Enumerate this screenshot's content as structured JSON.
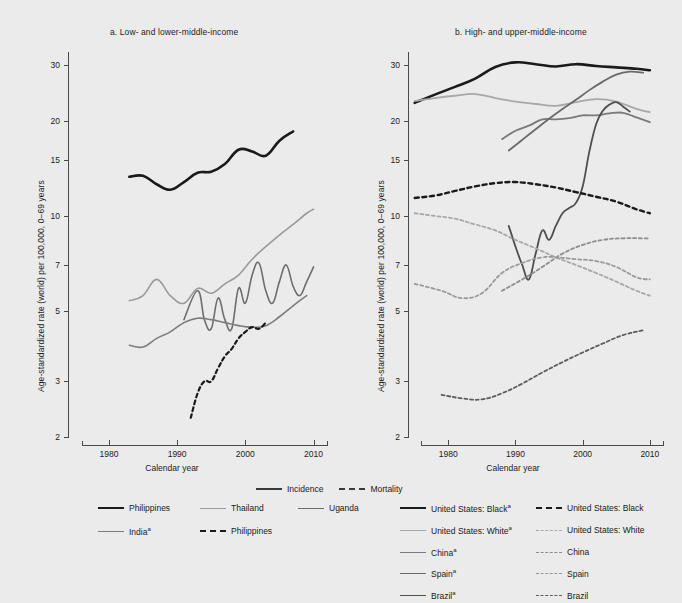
{
  "figure": {
    "background": "#ebebeb",
    "panels": [
      {
        "id": "a",
        "title": "a. Low- and lower-middle-income"
      },
      {
        "id": "b",
        "title": "b. High- and upper-middle-income"
      }
    ],
    "axis_label_y": "Age-standardized rate (world) per 100,000, 0–69 years",
    "axis_label_x": "Calendar year"
  },
  "legend_style": {
    "items": [
      {
        "label": "Incidence",
        "style": "solid",
        "color": "#3a3a3a",
        "icon": "line-solid-icon"
      },
      {
        "label": "Mortality",
        "style": "dashed",
        "color": "#3a3a3a",
        "icon": "line-dashed-icon"
      }
    ]
  },
  "legend_a": {
    "items": [
      {
        "label": "Philippines",
        "style": "solid",
        "weight": "thick",
        "color": "#1a1a1a",
        "icon": "line-solid-icon"
      },
      {
        "label": "Thailand",
        "style": "solid",
        "weight": "normal",
        "color": "#9a9a9a",
        "icon": "line-solid-icon"
      },
      {
        "label": "Uganda",
        "style": "solid",
        "weight": "normal",
        "color": "#6e6e6e",
        "icon": "line-solid-icon"
      },
      {
        "label": "India",
        "sup": "a",
        "style": "solid",
        "weight": "normal",
        "color": "#7d7d7d",
        "icon": "line-solid-icon"
      },
      {
        "label": "Philippines",
        "style": "dashed",
        "weight": "thick",
        "color": "#1a1a1a",
        "icon": "line-dashed-icon"
      }
    ]
  },
  "legend_b": {
    "items": [
      {
        "label": "United States: Black",
        "sup": "a",
        "style": "solid",
        "weight": "thick",
        "color": "#1a1a1a",
        "icon": "line-solid-icon"
      },
      {
        "label": "United States: Black",
        "style": "dashed",
        "weight": "thick",
        "color": "#1a1a1a",
        "icon": "line-dashed-icon"
      },
      {
        "label": "United States: White",
        "sup": "a",
        "style": "solid",
        "weight": "normal",
        "color": "#a8a8a8",
        "icon": "line-solid-icon"
      },
      {
        "label": "United States: White",
        "style": "dashed",
        "weight": "normal",
        "color": "#a8a8a8",
        "icon": "line-dashed-icon"
      },
      {
        "label": "China",
        "sup": "a",
        "style": "solid",
        "weight": "normal",
        "color": "#7a7a7a",
        "icon": "line-solid-icon"
      },
      {
        "label": "China",
        "style": "dashed",
        "weight": "normal",
        "color": "#8d8d8d",
        "icon": "line-dashed-icon"
      },
      {
        "label": "Spain",
        "sup": "a",
        "style": "solid",
        "weight": "normal",
        "color": "#6a6a6a",
        "icon": "line-solid-icon"
      },
      {
        "label": "Spain",
        "style": "dashed",
        "weight": "normal",
        "color": "#9a9a9a",
        "icon": "line-dashed-icon"
      },
      {
        "label": "Brazil",
        "sup": "a",
        "style": "solid",
        "weight": "normal",
        "color": "#4f4f4f",
        "icon": "line-solid-icon"
      },
      {
        "label": "Brazil",
        "style": "dashed",
        "weight": "normal",
        "color": "#5d5d5d",
        "icon": "line-dashed-icon"
      }
    ]
  },
  "chart_data": [
    {
      "type": "line",
      "panel": "a",
      "title": "a. Low- and lower-middle-income",
      "xlabel": "Calendar year",
      "ylabel": "Age-standardized rate (world) per 100,000, 0–69 years",
      "yscale": "log",
      "ylim": [
        2,
        33
      ],
      "yticks": [
        2,
        3,
        5,
        7,
        10,
        15,
        20,
        30
      ],
      "xlim": [
        1974,
        2013
      ],
      "xticks": [
        1980,
        1990,
        2000,
        2010
      ],
      "grid": false,
      "legend_position": "below",
      "series": [
        {
          "name": "Philippines",
          "measure": "Incidence",
          "style": "solid",
          "color": "#1a1a1a",
          "width": 2.6,
          "x": [
            1983,
            1985,
            1987,
            1989,
            1991,
            1993,
            1995,
            1997,
            1999,
            2001,
            2003,
            2005,
            2007
          ],
          "y": [
            13.3,
            13.4,
            12.6,
            12.1,
            12.8,
            13.7,
            13.8,
            14.6,
            16.2,
            16.0,
            15.5,
            17.3,
            18.5
          ]
        },
        {
          "name": "Thailand",
          "measure": "Incidence",
          "style": "solid",
          "color": "#9a9a9a",
          "width": 1.6,
          "x": [
            1983,
            1985,
            1987,
            1989,
            1991,
            1993,
            1995,
            1997,
            1999,
            2001,
            2003,
            2005,
            2007,
            2009,
            2010
          ],
          "y": [
            5.4,
            5.6,
            6.3,
            5.6,
            5.3,
            5.9,
            5.7,
            6.1,
            6.5,
            7.3,
            8.0,
            8.7,
            9.4,
            10.2,
            10.5
          ]
        },
        {
          "name": "Uganda",
          "measure": "Incidence",
          "style": "solid",
          "color": "#6e6e6e",
          "width": 1.6,
          "x": [
            1991,
            1993,
            1994,
            1995,
            1996,
            1997,
            1998,
            1999,
            2000,
            2001,
            2002,
            2003,
            2004,
            2005,
            2006,
            2007,
            2008,
            2009,
            2010
          ],
          "y": [
            4.7,
            5.8,
            4.7,
            4.4,
            5.5,
            4.7,
            4.4,
            5.9,
            5.3,
            6.5,
            7.1,
            5.8,
            5.3,
            6.2,
            7.0,
            6.0,
            5.6,
            6.2,
            6.9
          ]
        },
        {
          "name": "India",
          "measure": "Incidence",
          "style": "solid",
          "color": "#7d7d7d",
          "width": 1.6,
          "x": [
            1983,
            1985,
            1987,
            1989,
            1991,
            1993,
            1995,
            1997,
            1999,
            2001,
            2003,
            2005,
            2007,
            2009
          ],
          "y": [
            3.9,
            3.85,
            4.1,
            4.3,
            4.6,
            4.75,
            4.7,
            4.6,
            4.5,
            4.45,
            4.5,
            4.8,
            5.2,
            5.6
          ]
        },
        {
          "name": "Philippines",
          "measure": "Mortality",
          "style": "dashed",
          "color": "#1a1a1a",
          "width": 2.2,
          "x": [
            1992,
            1993,
            1994,
            1995,
            1996,
            1997,
            1998,
            1999,
            2000,
            2001,
            2002,
            2003
          ],
          "y": [
            2.3,
            2.75,
            3.0,
            3.0,
            3.3,
            3.6,
            3.8,
            4.1,
            4.3,
            4.45,
            4.4,
            4.6
          ]
        }
      ]
    },
    {
      "type": "line",
      "panel": "b",
      "title": "b. High- and upper-middle-income",
      "xlabel": "Calendar year",
      "ylabel": "Age-standardized rate (world) per 100,000, 0–69 years",
      "yscale": "log",
      "ylim": [
        2,
        33
      ],
      "yticks": [
        2,
        3,
        5,
        7,
        10,
        15,
        20,
        30
      ],
      "xlim": [
        1974,
        2013
      ],
      "xticks": [
        1980,
        1990,
        2000,
        2010
      ],
      "grid": false,
      "legend_position": "below",
      "series": [
        {
          "name": "United States: Black",
          "measure": "Incidence",
          "style": "solid",
          "color": "#1a1a1a",
          "width": 2.6,
          "x": [
            1975,
            1978,
            1981,
            1984,
            1987,
            1990,
            1993,
            1996,
            1999,
            2002,
            2005,
            2008,
            2010
          ],
          "y": [
            22.8,
            24.2,
            25.6,
            27.2,
            29.6,
            30.6,
            30.2,
            29.7,
            30.2,
            29.8,
            29.5,
            29.2,
            28.9
          ]
        },
        {
          "name": "United States: White",
          "measure": "Incidence",
          "style": "solid",
          "color": "#a8a8a8",
          "width": 1.8,
          "x": [
            1975,
            1978,
            1981,
            1984,
            1987,
            1990,
            1993,
            1996,
            1999,
            2002,
            2005,
            2008,
            2010
          ],
          "y": [
            23.1,
            23.6,
            24.0,
            24.3,
            23.6,
            23.0,
            22.6,
            22.3,
            22.9,
            23.4,
            23.0,
            21.8,
            21.3
          ]
        },
        {
          "name": "China",
          "measure": "Incidence",
          "style": "solid",
          "color": "#7a7a7a",
          "width": 1.8,
          "x": [
            1988,
            1990,
            1992,
            1994,
            1996,
            1998,
            2000,
            2002,
            2004,
            2006,
            2008,
            2010
          ],
          "y": [
            17.5,
            18.6,
            19.3,
            20.2,
            20.2,
            20.4,
            20.8,
            20.8,
            21.1,
            21.2,
            20.5,
            19.8
          ]
        },
        {
          "name": "Spain",
          "measure": "Incidence",
          "style": "solid",
          "color": "#6a6a6a",
          "width": 1.8,
          "x": [
            1989,
            1991,
            1993,
            1995,
            1997,
            1999,
            2001,
            2003,
            2005,
            2007,
            2009
          ],
          "y": [
            16.1,
            17.4,
            18.8,
            20.3,
            21.8,
            23.3,
            25.0,
            26.6,
            28.0,
            28.6,
            28.4
          ]
        },
        {
          "name": "Brazil",
          "measure": "Incidence",
          "style": "solid",
          "color": "#4f4f4f",
          "width": 1.8,
          "x": [
            1989,
            1990,
            1991,
            1992,
            1993,
            1994,
            1995,
            1996,
            1997,
            1998,
            1999,
            2000,
            2001,
            2002,
            2003,
            2004,
            2005,
            2006,
            2007
          ],
          "y": [
            9.3,
            8.0,
            7.0,
            6.3,
            7.6,
            9.0,
            8.4,
            9.3,
            10.2,
            10.6,
            11.0,
            12.4,
            16.0,
            19.5,
            21.5,
            22.5,
            22.9,
            22.2,
            21.4
          ]
        },
        {
          "name": "United States: Black",
          "measure": "Mortality",
          "style": "dashed",
          "color": "#1a1a1a",
          "width": 2.4,
          "x": [
            1975,
            1978,
            1981,
            1984,
            1987,
            1990,
            1993,
            1996,
            1999,
            2002,
            2005,
            2008,
            2010
          ],
          "y": [
            11.4,
            11.6,
            12.0,
            12.4,
            12.7,
            12.8,
            12.6,
            12.3,
            11.9,
            11.5,
            11.1,
            10.5,
            10.2
          ]
        },
        {
          "name": "United States: White",
          "measure": "Mortality",
          "style": "dashed",
          "color": "#a8a8a8",
          "width": 1.8,
          "x": [
            1975,
            1978,
            1981,
            1984,
            1987,
            1990,
            1993,
            1996,
            1999,
            2002,
            2005,
            2008,
            2010
          ],
          "y": [
            10.2,
            10.0,
            9.8,
            9.4,
            9.0,
            8.4,
            7.9,
            7.4,
            7.0,
            6.6,
            6.2,
            5.8,
            5.6
          ]
        },
        {
          "name": "China",
          "measure": "Mortality",
          "style": "dashed",
          "color": "#8d8d8d",
          "width": 1.8,
          "x": [
            1988,
            1991,
            1994,
            1997,
            2000,
            2003,
            2006,
            2009,
            2010
          ],
          "y": [
            5.8,
            6.3,
            6.9,
            7.6,
            8.1,
            8.4,
            8.5,
            8.5,
            8.5
          ]
        },
        {
          "name": "Spain",
          "measure": "Mortality",
          "style": "dashed",
          "color": "#9a9a9a",
          "width": 1.8,
          "x": [
            1975,
            1979,
            1982,
            1985,
            1988,
            1991,
            1994,
            1996,
            1999,
            2002,
            2005,
            2008,
            2010
          ],
          "y": [
            6.1,
            5.8,
            5.5,
            5.7,
            6.6,
            7.1,
            7.4,
            7.4,
            7.3,
            7.2,
            6.9,
            6.4,
            6.3
          ]
        },
        {
          "name": "Brazil",
          "measure": "Mortality",
          "style": "dashed",
          "color": "#5d5d5d",
          "width": 1.8,
          "x": [
            1979,
            1982,
            1985,
            1988,
            1991,
            1994,
            1997,
            2000,
            2003,
            2006,
            2009
          ],
          "y": [
            2.72,
            2.65,
            2.63,
            2.75,
            2.95,
            3.2,
            3.45,
            3.7,
            3.95,
            4.2,
            4.35
          ]
        }
      ]
    }
  ]
}
